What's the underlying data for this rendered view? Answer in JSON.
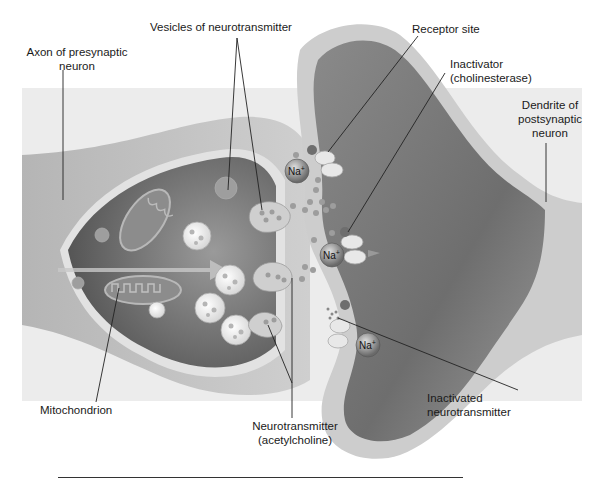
{
  "diagram": {
    "labels": {
      "axon": [
        "Axon of presynaptic",
        "neuron"
      ],
      "vesicles": "Vesicles of neurotransmitter",
      "receptor": "Receptor site",
      "inactivator": [
        "Inactivator",
        "(cholinesterase)"
      ],
      "dendrite": [
        "Dendrite of",
        "postsynaptic",
        "neuron"
      ],
      "mitochondrion": "Mitochondrion",
      "neurotransmitter": [
        "Neurotransmitter",
        "(acetylcholine)"
      ],
      "inactivated": [
        "Inactivated",
        "neurotransmitter"
      ]
    },
    "ions": [
      "Na+",
      "Na+",
      "Na+"
    ],
    "colors": {
      "background": "#ffffff",
      "axon_outer": "#a9a9a9",
      "axon_inner": "#7a7a7a",
      "membrane": "#d8d8d8",
      "dendrite_inner": "#858585",
      "cleft": "#f2f2f2",
      "leader_line": "#222222"
    }
  }
}
